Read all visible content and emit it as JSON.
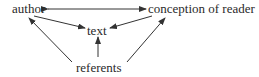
{
  "diagram": {
    "nodes": [
      {
        "id": "author",
        "label": "author"
      },
      {
        "id": "reader",
        "label": "conception of reader"
      },
      {
        "id": "text",
        "label": "text"
      },
      {
        "id": "referents",
        "label": "referents"
      }
    ],
    "edges": [
      {
        "from": "author",
        "to": "reader",
        "bidirectional": true
      },
      {
        "from": "author",
        "to": "text"
      },
      {
        "from": "reader",
        "to": "text"
      },
      {
        "from": "referents",
        "to": "text"
      },
      {
        "from": "referents",
        "to": "author"
      },
      {
        "from": "referents",
        "to": "reader"
      }
    ],
    "colors": {
      "line": "#333333",
      "text": "#2a2a2a"
    }
  }
}
